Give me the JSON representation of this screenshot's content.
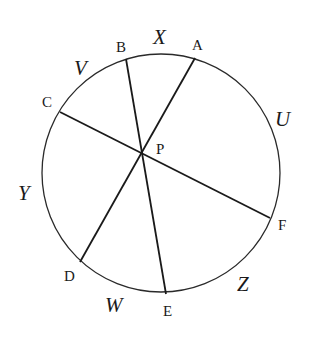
{
  "diagram": {
    "circle": {
      "cx": 161,
      "cy": 173,
      "r": 119
    },
    "intersection": {
      "name": "P",
      "x": 142,
      "y": 153
    },
    "points": [
      {
        "name": "A",
        "x": 195,
        "y": 58
      },
      {
        "name": "B",
        "x": 126,
        "y": 59
      },
      {
        "name": "C",
        "x": 60,
        "y": 112
      },
      {
        "name": "D",
        "x": 80,
        "y": 262
      },
      {
        "name": "E",
        "x": 166,
        "y": 294
      },
      {
        "name": "F",
        "x": 270,
        "y": 218
      }
    ],
    "chords": [
      {
        "from": "A",
        "to": "D"
      },
      {
        "from": "B",
        "to": "E"
      },
      {
        "from": "C",
        "to": "F"
      }
    ],
    "point_labels": {
      "A": "A",
      "B": "B",
      "C": "C",
      "D": "D",
      "E": "E",
      "F": "F",
      "P": "P"
    },
    "arc_labels": {
      "U": "U",
      "V": "V",
      "W": "W",
      "X": "X",
      "Y": "Y",
      "Z": "Z"
    }
  }
}
